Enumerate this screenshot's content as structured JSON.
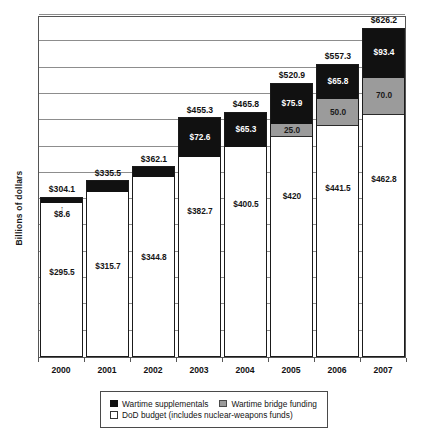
{
  "chart_data": {
    "type": "bar",
    "subtype": "stacked-bar",
    "title": "",
    "xlabel": "",
    "ylabel": "Billions of dollars",
    "ylim": [
      0,
      650
    ],
    "grid": true,
    "grid_interval": 50,
    "legend_position": "bottom",
    "categories": [
      "2000",
      "2001",
      "2002",
      "2003",
      "2004",
      "2005",
      "2006",
      "2007"
    ],
    "series": [
      {
        "name": "DoD budget (includes nuclear-weapons funds)",
        "key": "dod",
        "color": "#ffffff",
        "values": [
          295.5,
          315.7,
          344.8,
          382.7,
          400.5,
          420,
          441.5,
          462.8
        ],
        "labels": [
          "$295.5",
          "$315.7",
          "$344.8",
          "$382.7",
          "$400.5",
          "$420",
          "$441.5",
          "$462.8"
        ]
      },
      {
        "name": "Wartime bridge funding",
        "key": "bridge",
        "color": "#9b9b9b",
        "values": [
          0,
          0,
          0,
          0,
          0,
          25.0,
          50.0,
          70.0
        ],
        "labels": [
          "",
          "",
          "",
          "",
          "",
          "25.0",
          "50.0",
          "70.0"
        ]
      },
      {
        "name": "Wartime supplementals",
        "key": "supplementals",
        "color": "#111111",
        "values": [
          8.6,
          19.8,
          17.3,
          72.6,
          65.3,
          75.9,
          65.8,
          93.4
        ],
        "labels": [
          "$8.6",
          "$19.8",
          "$17.3",
          "$72.6",
          "$65.3",
          "$75.9",
          "$65.8",
          "$93.4"
        ]
      }
    ],
    "totals": [
      304.1,
      335.5,
      362.1,
      455.3,
      465.8,
      520.9,
      557.3,
      626.2
    ],
    "total_labels": [
      "$304.1",
      "$335.5",
      "$362.1",
      "$455.3",
      "$465.8",
      "$520.9",
      "$557.3",
      "$626.2"
    ],
    "callouts": [
      {
        "category": "2000",
        "series": "supplementals",
        "label": "$8.6",
        "arrow": "↑"
      }
    ]
  },
  "axes": {
    "y_title": "Billions of dollars"
  },
  "legend": {
    "entries": [
      {
        "label": "Wartime supplementals",
        "swatch": "black-square-icon",
        "color": "#111111"
      },
      {
        "label": "Wartime bridge funding",
        "swatch": "gray-square-icon",
        "color": "#9b9b9b"
      },
      {
        "label": "DoD budget (includes nuclear-weapons funds)",
        "swatch": "white-square-icon",
        "color": "#ffffff"
      }
    ]
  },
  "colors": {
    "supplementals": "#111111",
    "bridge": "#9b9b9b",
    "dod": "#ffffff",
    "frame": "#555555",
    "grid": "#8d8d8d"
  }
}
